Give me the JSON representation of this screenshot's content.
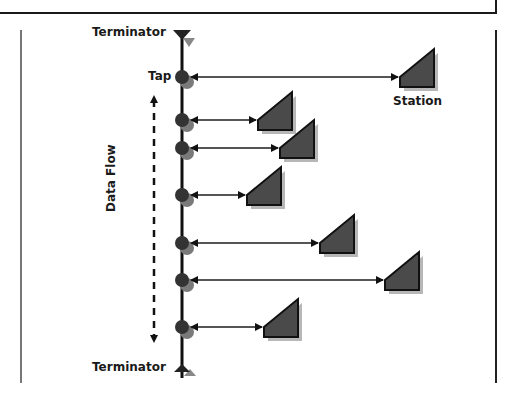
{
  "diagram": {
    "labels": {
      "terminator_top": "Terminator",
      "terminator_bottom": "Terminator",
      "tap": "Tap",
      "station": "Station",
      "data_flow": "Data Flow"
    },
    "colors": {
      "line": "#1a1a1a",
      "node": "#333333",
      "node_shadow": "#777777",
      "station_fill": "#4a4a4a",
      "terminator_shadow": "#888888",
      "arrow": "#555555"
    },
    "bus": {
      "x": 182,
      "y_top": 38,
      "y_bottom": 378
    },
    "taps": [
      {
        "y": 77,
        "station_x": 400,
        "label": "Tap"
      },
      {
        "y": 120,
        "station_x": 258
      },
      {
        "y": 148,
        "station_x": 280
      },
      {
        "y": 195,
        "station_x": 247
      },
      {
        "y": 243,
        "station_x": 320
      },
      {
        "y": 280,
        "station_x": 385
      },
      {
        "y": 327,
        "station_x": 264
      }
    ]
  }
}
